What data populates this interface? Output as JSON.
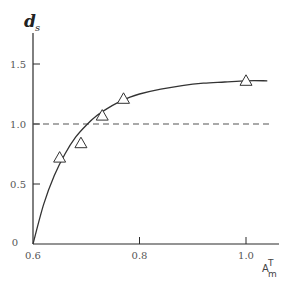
{
  "chart_data": {
    "type": "scatter",
    "title": "",
    "xlabel": "A_m^T",
    "xlabel_main": "A",
    "xlabel_sup": "T",
    "xlabel_sub": "m",
    "ylabel": "d_s",
    "ylabel_main": "d",
    "ylabel_sub": "s",
    "xlim": [
      0.6,
      1.06
    ],
    "ylim": [
      0,
      1.65
    ],
    "grid": false,
    "x_ticks": [
      0.6,
      0.8,
      1.0
    ],
    "x_tick_labels": [
      "0.6",
      "0.8",
      "1.0"
    ],
    "y_ticks": [
      0,
      0.5,
      1.0,
      1.5
    ],
    "y_tick_labels": [
      "0",
      "0.5",
      "1.0",
      "1.5"
    ],
    "series": [
      {
        "name": "observed",
        "marker": "triangle-open",
        "x": [
          0.65,
          0.69,
          0.73,
          0.77,
          1.0
        ],
        "y": [
          0.72,
          0.84,
          1.07,
          1.21,
          1.36
        ]
      },
      {
        "name": "fitted curve",
        "style": "solid-line",
        "x": [
          0.6,
          0.62,
          0.64,
          0.66,
          0.68,
          0.7,
          0.72,
          0.74,
          0.76,
          0.78,
          0.8,
          0.84,
          0.88,
          0.92,
          0.96,
          1.0,
          1.04
        ],
        "y": [
          0.0,
          0.33,
          0.57,
          0.75,
          0.89,
          0.99,
          1.07,
          1.13,
          1.18,
          1.22,
          1.25,
          1.29,
          1.32,
          1.34,
          1.35,
          1.36,
          1.36
        ]
      },
      {
        "name": "reference d_s = 1",
        "style": "dashed-line",
        "x": [
          0.6,
          1.06
        ],
        "y": [
          1.0,
          1.0
        ]
      }
    ],
    "legend": "none"
  }
}
